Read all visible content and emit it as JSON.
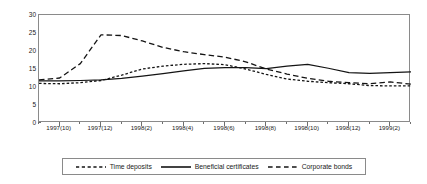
{
  "chart_data": {
    "type": "line",
    "title": "",
    "subtitle": "",
    "xlabel": "",
    "ylabel": "",
    "ylim": [
      0,
      30
    ],
    "yticks": [
      0,
      5,
      10,
      15,
      20,
      25,
      30
    ],
    "grid": false,
    "legend_position": "bottom",
    "x": [
      "1997(9)",
      "1997(10)",
      "1997(11)",
      "1997(12)",
      "1998(1)",
      "1998(2)",
      "1998(3)",
      "1998(4)",
      "1998(5)",
      "1998(6)",
      "1998(7)",
      "1998(8)",
      "1998(9)",
      "1998(10)",
      "1998(11)",
      "1998(12)",
      "1999(1)",
      "1999(2)",
      "1999(3)"
    ],
    "xtick_labels": [
      "1997(10)",
      "1997(12)",
      "1998(2)",
      "1998(4)",
      "1998(6)",
      "1998(8)",
      "1998(10)",
      "1998(12)",
      "1999(2)"
    ],
    "xtick_label_indices": [
      1,
      3,
      5,
      7,
      9,
      11,
      13,
      15,
      17
    ],
    "series": [
      {
        "name": "Time deposits",
        "style": "dotted",
        "values": [
          11.0,
          10.9,
          11.2,
          11.8,
          13.3,
          15.0,
          15.8,
          16.3,
          16.5,
          16.2,
          15.0,
          13.5,
          12.2,
          11.6,
          11.2,
          10.9,
          10.4,
          10.3,
          10.3
        ]
      },
      {
        "name": "Beneficial certificates",
        "style": "solid",
        "values": [
          11.7,
          11.7,
          11.8,
          12.0,
          12.4,
          13.0,
          13.7,
          14.5,
          15.2,
          15.4,
          15.4,
          15.1,
          15.8,
          16.3,
          15.2,
          14.0,
          13.8,
          14.0,
          14.2
        ]
      },
      {
        "name": "Corporate bonds",
        "style": "dashed",
        "values": [
          12.0,
          12.5,
          16.5,
          24.5,
          24.3,
          22.8,
          21.0,
          19.8,
          19.0,
          18.3,
          17.0,
          15.0,
          13.6,
          12.4,
          11.6,
          11.2,
          10.9,
          11.4,
          10.8
        ]
      }
    ]
  },
  "legend": {
    "items": [
      {
        "label": "Time deposits",
        "style": "dotted"
      },
      {
        "label": "Beneficial certificates",
        "style": "solid"
      },
      {
        "label": "Corporate bonds",
        "style": "dashed"
      }
    ]
  }
}
